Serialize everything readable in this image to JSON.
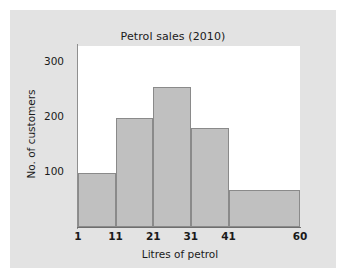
{
  "chart_data": {
    "type": "bar",
    "title": "Petrol sales (2010)",
    "xlabel": "Litres of petrol",
    "ylabel": "No. of customers",
    "bin_edges": [
      1,
      11,
      21,
      31,
      41,
      60
    ],
    "categories": [
      "1-11",
      "11-21",
      "21-31",
      "31-41",
      "41-60"
    ],
    "values": [
      98,
      198,
      255,
      180,
      67
    ],
    "xtick_labels": [
      "1",
      "11",
      "21",
      "31",
      "41",
      "60"
    ],
    "ytick_labels": [
      "100",
      "200",
      "300"
    ],
    "ytick_values": [
      100,
      200,
      300
    ],
    "ylim": [
      0,
      330
    ],
    "xlim": [
      1,
      60
    ],
    "grid": false,
    "legend": null,
    "bar_fill_color": "#c0c0c0",
    "bar_edge_color": "#8a8a8a",
    "plot_background": "#ffffff",
    "figure_background": "#e3e3e3",
    "page_background": "#ffffff",
    "text_color": "#1a1a1a"
  }
}
